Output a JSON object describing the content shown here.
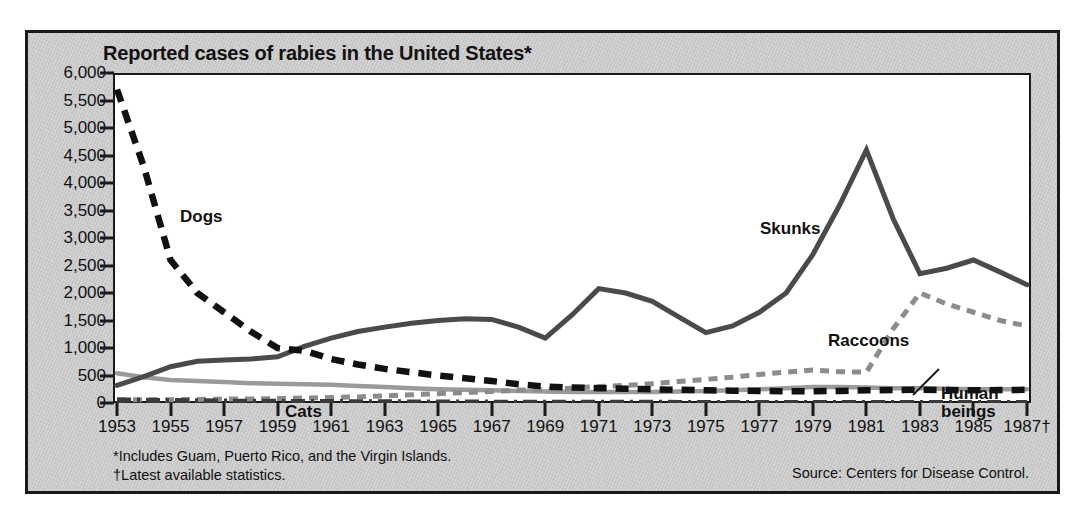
{
  "figure": {
    "title": "Reported cases of rabies in the United States*",
    "background_color": "#c9c9c9",
    "plot_background_color": "#ffffff",
    "border_color": "#1a1a1a",
    "footnote_1": "*Includes Guam, Puerto Rico, and the Virgin Islands.",
    "footnote_2": "†Latest available statistics.",
    "source": "Source: Centers for Disease Control."
  },
  "chart_data": {
    "type": "line",
    "title": "Reported cases of rabies in the United States*",
    "xlabel": "",
    "ylabel": "",
    "xlim": [
      1953,
      1987
    ],
    "ylim": [
      0,
      6000
    ],
    "grid": false,
    "legend_position": "inline-labels",
    "x": [
      1953,
      1954,
      1955,
      1956,
      1957,
      1958,
      1959,
      1960,
      1961,
      1962,
      1963,
      1964,
      1965,
      1966,
      1967,
      1968,
      1969,
      1970,
      1971,
      1972,
      1973,
      1974,
      1975,
      1976,
      1977,
      1978,
      1979,
      1980,
      1981,
      1982,
      1983,
      1984,
      1985,
      1986,
      1987
    ],
    "ytick_labels": [
      "6,000",
      "5,500",
      "5,000",
      "4,500",
      "4,000",
      "3,500",
      "3,000",
      "2,500",
      "2,000",
      "1,500",
      "1,000",
      "500",
      "0"
    ],
    "ytick_values": [
      6000,
      5500,
      5000,
      4500,
      4000,
      3500,
      3000,
      2500,
      2000,
      1500,
      1000,
      500,
      0
    ],
    "xtick_labels": [
      "1953",
      "1955",
      "1957",
      "1959",
      "1961",
      "1963",
      "1965",
      "1967",
      "1969",
      "1971",
      "1973",
      "1975",
      "1977",
      "1979",
      "1981",
      "1983",
      "1985",
      "1987†"
    ],
    "xtick_values": [
      1953,
      1955,
      1957,
      1959,
      1961,
      1963,
      1965,
      1967,
      1969,
      1971,
      1973,
      1975,
      1977,
      1979,
      1981,
      1983,
      1985,
      1987
    ],
    "series": [
      {
        "name": "Dogs",
        "label": "Dogs",
        "style": "dashed-thick",
        "color": "#111111",
        "values": [
          5700,
          4300,
          2600,
          2000,
          1650,
          1300,
          1000,
          950,
          800,
          700,
          620,
          560,
          500,
          450,
          400,
          340,
          300,
          280,
          270,
          260,
          250,
          240,
          230,
          225,
          220,
          215,
          215,
          220,
          230,
          235,
          240,
          235,
          230,
          235,
          240
        ]
      },
      {
        "name": "Skunks",
        "label": "Skunks",
        "style": "solid-thick",
        "color": "#4a4a4a",
        "values": [
          320,
          480,
          660,
          760,
          780,
          800,
          840,
          1030,
          1180,
          1300,
          1380,
          1450,
          1500,
          1530,
          1520,
          1380,
          1180,
          1600,
          2080,
          2000,
          1850,
          1560,
          1280,
          1400,
          1650,
          2000,
          2700,
          3600,
          4600,
          3350,
          2350,
          2450,
          2600,
          2380,
          2150
        ]
      },
      {
        "name": "Raccoons",
        "label": "Raccoons",
        "style": "dotted-thick",
        "color": "#8c8c8c",
        "values": [
          60,
          60,
          60,
          65,
          70,
          75,
          80,
          90,
          100,
          110,
          130,
          150,
          170,
          190,
          210,
          230,
          250,
          270,
          300,
          320,
          350,
          390,
          430,
          470,
          520,
          560,
          600,
          570,
          560,
          1350,
          2000,
          1800,
          1650,
          1500,
          1400
        ]
      },
      {
        "name": "Cats",
        "label": "Cats",
        "style": "solid-gray",
        "color": "#9a9a9a",
        "values": [
          540,
          470,
          420,
          400,
          380,
          360,
          350,
          340,
          330,
          310,
          290,
          270,
          250,
          240,
          230,
          220,
          210,
          200,
          200,
          200,
          200,
          210,
          220,
          230,
          250,
          270,
          290,
          290,
          280,
          270,
          270,
          260,
          250,
          250,
          250
        ]
      },
      {
        "name": "Human beings",
        "label": "Human beings",
        "style": "dash-dot",
        "color": "#3a3a3a",
        "values": [
          55,
          50,
          45,
          40,
          35,
          32,
          30,
          28,
          26,
          24,
          22,
          20,
          18,
          18,
          16,
          15,
          14,
          14,
          13,
          12,
          12,
          11,
          11,
          10,
          10,
          10,
          10,
          10,
          10,
          10,
          10,
          10,
          10,
          10,
          10
        ]
      }
    ],
    "series_label_positions": [
      {
        "name": "Dogs",
        "x_px": 152,
        "y_px": 175
      },
      {
        "name": "Skunks",
        "x_px": 732,
        "y_px": 187
      },
      {
        "name": "Raccoons",
        "x_px": 800,
        "y_px": 299
      },
      {
        "name": "Cats",
        "x_px": 257,
        "y_px": 370
      },
      {
        "name": "Human beings",
        "x_px": 913,
        "y_px": 352
      }
    ]
  }
}
